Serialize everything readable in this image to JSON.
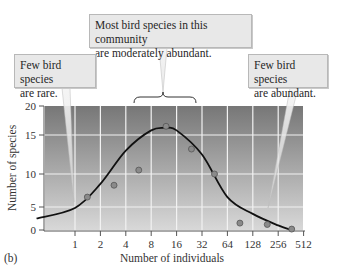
{
  "chart_data": {
    "type": "line",
    "panel_label": "(b)",
    "title": "",
    "xlabel": "Number of individuals",
    "ylabel": "Number of species",
    "x_scale": "log2",
    "x_ticks": [
      "1",
      "2",
      "4",
      "8",
      "16",
      "32",
      "64",
      "128",
      "256",
      "512"
    ],
    "y_ticks": [
      "0",
      "5",
      "10",
      "15",
      "20"
    ],
    "ylim": [
      0,
      20
    ],
    "xlim": [
      0.35,
      512
    ],
    "grid": true,
    "series": [
      {
        "name": "observed",
        "kind": "scatter",
        "points": [
          {
            "x": 1.4,
            "y": 6.5
          },
          {
            "x": 2.9,
            "y": 8.3
          },
          {
            "x": 5.7,
            "y": 10.5
          },
          {
            "x": 12,
            "y": 16.5
          },
          {
            "x": 24,
            "y": 13.2
          },
          {
            "x": 45,
            "y": 10
          },
          {
            "x": 90,
            "y": 1.5
          },
          {
            "x": 190,
            "y": 1.2
          },
          {
            "x": 370,
            "y": 0.2
          }
        ]
      },
      {
        "name": "fitted lognormal curve",
        "kind": "line",
        "points": [
          {
            "x": 0.35,
            "y": 2.5
          },
          {
            "x": 1,
            "y": 4.8
          },
          {
            "x": 2,
            "y": 8.5
          },
          {
            "x": 4,
            "y": 13
          },
          {
            "x": 8,
            "y": 15.8
          },
          {
            "x": 12,
            "y": 16.2
          },
          {
            "x": 16,
            "y": 15.8
          },
          {
            "x": 32,
            "y": 12.5
          },
          {
            "x": 64,
            "y": 6.5
          },
          {
            "x": 128,
            "y": 3.5
          },
          {
            "x": 256,
            "y": 1
          },
          {
            "x": 370,
            "y": 0
          }
        ]
      }
    ],
    "annotations": [
      {
        "text": "Most bird species in this community are moderately abundant.",
        "target": "peak (x 4–32)"
      },
      {
        "text": "Few bird species are rare.",
        "target": "x ≈ 1"
      },
      {
        "text": "Few bird species are abundant.",
        "target": "x ≈ 256"
      }
    ]
  },
  "callouts": {
    "middle": {
      "line1": "Most bird species in this community",
      "line2": "are moderately abundant."
    },
    "left": {
      "line1": "Few bird species",
      "line2": "are rare."
    },
    "right": {
      "line1": "Few bird species",
      "line2": "are abundant."
    }
  },
  "labels": {
    "panel": "(b)",
    "xlabel": "Number of individuals",
    "ylabel": "Number of species"
  },
  "colors": {
    "plot_top": "#777777",
    "plot_bottom": "#d6d6d6",
    "curve": "#111111",
    "point_fill": "#8a8a8a",
    "grid": "#f2f2f2"
  }
}
